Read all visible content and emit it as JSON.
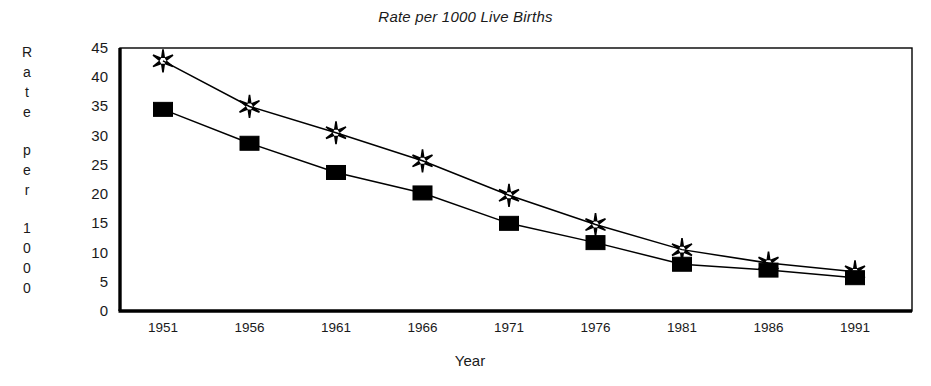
{
  "chart_data": {
    "type": "line",
    "title": "Rate per 1000 Live Births",
    "xlabel": "Year",
    "ylabel": "Rate per 1000",
    "ylabel_chars": [
      "R",
      "a",
      "t",
      "e",
      "",
      "p",
      "e",
      "r",
      "",
      "1",
      "0",
      "0",
      "0"
    ],
    "categories": [
      "1951",
      "1956",
      "1961",
      "1966",
      "1971",
      "1976",
      "1981",
      "1986",
      "1991"
    ],
    "x": [
      1951,
      1956,
      1961,
      1966,
      1971,
      1976,
      1981,
      1986,
      1991
    ],
    "series": [
      {
        "name": "star-series",
        "marker": "star",
        "color": "#000000",
        "values": [
          42.8,
          35.0,
          30.5,
          25.7,
          19.8,
          14.8,
          10.5,
          8.2,
          6.7
        ]
      },
      {
        "name": "square-series",
        "marker": "square",
        "color": "#000000",
        "values": [
          34.5,
          28.7,
          23.7,
          20.2,
          15.0,
          11.7,
          8.0,
          7.0,
          5.7
        ]
      }
    ],
    "ylim": [
      0,
      45
    ],
    "yticks": [
      0,
      5,
      10,
      15,
      20,
      25,
      30,
      35,
      40,
      45
    ],
    "ytick_labels": [
      "0",
      "5",
      "10",
      "15",
      "20",
      "25",
      "30",
      "35",
      "40",
      "45"
    ],
    "grid": false,
    "legend": "none",
    "axis_color": "#000000",
    "background": "#ffffff"
  }
}
